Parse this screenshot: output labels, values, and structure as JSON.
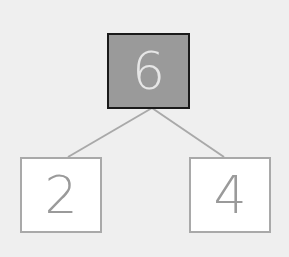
{
  "diagram": {
    "type": "number-bond",
    "whole": "6",
    "parts": [
      "2",
      "4"
    ]
  },
  "colors": {
    "background": "#efefef",
    "whole_fill": "#9a9a9a",
    "whole_border": "#1a1a1a",
    "whole_text": "#e6e6e6",
    "part_fill": "#ffffff",
    "part_border": "#a9a9a9",
    "connector": "#a9a9a9"
  }
}
